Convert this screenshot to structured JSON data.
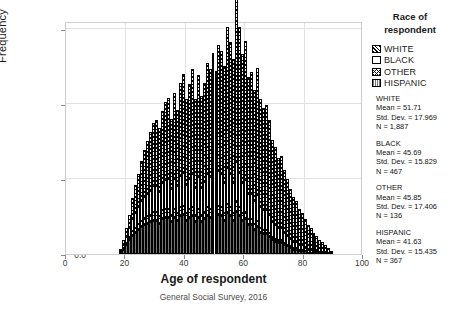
{
  "chart_data": {
    "type": "bar",
    "title": "",
    "xlabel": "Age of respondent",
    "ylabel": "Frequency",
    "caption": "General Social Survey, 2016",
    "xlim": [
      0,
      100
    ],
    "ylim": [
      0,
      155
    ],
    "xticks": [
      "0",
      "20",
      "40",
      "60",
      "80",
      "100"
    ],
    "yticks": [
      "0.0",
      "50.0",
      "100.0",
      "150.0"
    ],
    "grid": true,
    "legend_position": "right",
    "stacked": true,
    "bin_width": 1,
    "legend_title": "Race of respondent",
    "series": [
      {
        "name": "WHITE",
        "pattern": "diagonal-hatch",
        "values": [
          0,
          0,
          0,
          0,
          0,
          0,
          0,
          0,
          0,
          0,
          0,
          0,
          0,
          0,
          0,
          0,
          0,
          0,
          1,
          3,
          6,
          9,
          14,
          19,
          22,
          27,
          31,
          35,
          39,
          42,
          44,
          43,
          48,
          52,
          54,
          47,
          57,
          51,
          62,
          66,
          57,
          63,
          70,
          59,
          68,
          61,
          66,
          74,
          72,
          79,
          73,
          84,
          82,
          78,
          94,
          88,
          83,
          109,
          97,
          86,
          93,
          78,
          81,
          74,
          85,
          72,
          68,
          70,
          63,
          55,
          52,
          47,
          48,
          42,
          38,
          33,
          30,
          27,
          24,
          21,
          19,
          16,
          14,
          12,
          10,
          8,
          7,
          5,
          4,
          2
        ]
      },
      {
        "name": "BLACK",
        "pattern": "dots",
        "values": [
          0,
          0,
          0,
          0,
          0,
          0,
          0,
          0,
          0,
          0,
          0,
          0,
          0,
          0,
          0,
          0,
          0,
          0,
          1,
          2,
          4,
          6,
          8,
          10,
          11,
          13,
          14,
          15,
          16,
          17,
          17,
          16,
          18,
          19,
          20,
          17,
          20,
          18,
          21,
          22,
          19,
          20,
          22,
          18,
          21,
          18,
          20,
          22,
          21,
          23,
          21,
          23,
          22,
          20,
          24,
          22,
          20,
          26,
          23,
          20,
          21,
          17,
          17,
          15,
          17,
          14,
          13,
          13,
          12,
          10,
          9,
          8,
          8,
          7,
          6,
          5,
          4,
          4,
          3,
          3,
          2,
          2,
          2,
          1,
          1,
          1,
          1,
          1,
          0,
          0
        ]
      },
      {
        "name": "OTHER",
        "pattern": "cross-hatch",
        "values": [
          0,
          0,
          0,
          0,
          0,
          0,
          0,
          0,
          0,
          0,
          0,
          0,
          0,
          0,
          0,
          0,
          0,
          0,
          0,
          1,
          1,
          2,
          3,
          3,
          4,
          4,
          5,
          5,
          5,
          6,
          6,
          5,
          6,
          6,
          6,
          5,
          6,
          5,
          6,
          6,
          5,
          6,
          6,
          5,
          6,
          5,
          5,
          6,
          6,
          6,
          5,
          6,
          6,
          5,
          6,
          6,
          5,
          7,
          6,
          5,
          5,
          4,
          4,
          4,
          4,
          3,
          3,
          3,
          3,
          2,
          2,
          2,
          2,
          1,
          1,
          1,
          1,
          1,
          1,
          1,
          0,
          0,
          0,
          0,
          0,
          0,
          0,
          0,
          0,
          0
        ]
      },
      {
        "name": "HISPANIC",
        "pattern": "vertical-lines",
        "values": [
          0,
          0,
          0,
          0,
          0,
          0,
          0,
          0,
          0,
          0,
          0,
          0,
          0,
          0,
          0,
          0,
          0,
          0,
          1,
          3,
          6,
          9,
          12,
          14,
          16,
          18,
          19,
          20,
          21,
          22,
          22,
          20,
          23,
          24,
          24,
          21,
          24,
          22,
          25,
          26,
          22,
          24,
          25,
          21,
          24,
          21,
          23,
          25,
          24,
          26,
          23,
          26,
          25,
          22,
          27,
          25,
          22,
          28,
          25,
          22,
          23,
          19,
          19,
          16,
          18,
          14,
          13,
          13,
          11,
          9,
          8,
          7,
          7,
          6,
          5,
          4,
          3,
          3,
          2,
          2,
          2,
          1,
          1,
          1,
          1,
          0,
          0,
          0,
          0,
          0
        ]
      }
    ]
  },
  "legend": {
    "title_line1": "Race of",
    "title_line2": "respondent",
    "items": [
      {
        "label": "WHITE",
        "swatch": "diagonal-hatch-swatch"
      },
      {
        "label": "BLACK",
        "swatch": "dots-swatch"
      },
      {
        "label": "OTHER",
        "swatch": "cross-hatch-swatch"
      },
      {
        "label": "HISPANIC",
        "swatch": "vertical-lines-swatch"
      }
    ]
  },
  "stats": [
    {
      "name": "WHITE",
      "mean": "Mean = 51.71",
      "std": "Std. Dev. = 17.969",
      "n": "N = 1,887"
    },
    {
      "name": "BLACK",
      "mean": "Mean = 45.69",
      "std": "Std. Dev. = 15.829",
      "n": "N = 467"
    },
    {
      "name": "OTHER",
      "mean": "Mean = 45.85",
      "std": "Std. Dev. = 17.406",
      "n": "N = 136"
    },
    {
      "name": "HISPANIC",
      "mean": "Mean = 41.63",
      "std": "Std. Dev. = 15.435",
      "n": "N = 367"
    }
  ],
  "axes": {
    "y_label": "Frequency",
    "x_label": "Age of respondent",
    "caption": "General Social Survey, 2016",
    "y_ticks": [
      "0.0",
      "50.0",
      "100.0",
      "150.0"
    ],
    "x_ticks": [
      "0",
      "20",
      "40",
      "60",
      "80",
      "100"
    ]
  }
}
